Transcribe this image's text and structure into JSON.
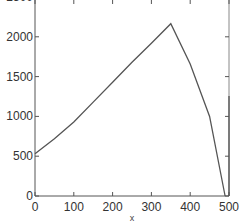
{
  "chart_data": {
    "type": "line",
    "title": "",
    "xlabel": "x",
    "ylabel": "",
    "xlim": [
      0,
      500
    ],
    "ylim": [
      0,
      2500
    ],
    "xticks": [
      0,
      100,
      200,
      300,
      400,
      500
    ],
    "yticks": [
      0,
      500,
      1000,
      1500,
      2000,
      2500
    ],
    "xtick_labels": [
      "0",
      "100",
      "200",
      "300",
      "400",
      "500"
    ],
    "ytick_labels": [
      "0",
      "500",
      "1000",
      "1500",
      "2000",
      "2500"
    ],
    "grid": false,
    "legend": null,
    "series": [
      {
        "name": "curve",
        "color": "#555555",
        "x": [
          0,
          50,
          100,
          150,
          200,
          250,
          300,
          350,
          400,
          450,
          490
        ],
        "y": [
          530,
          720,
          930,
          1180,
          1430,
          1680,
          1920,
          2165,
          1660,
          1000,
          0
        ]
      }
    ],
    "peak": {
      "x": 300,
      "y": 2165
    },
    "colors": {
      "axis": "#555555",
      "line": "#555555",
      "background": "#ffffff"
    }
  }
}
